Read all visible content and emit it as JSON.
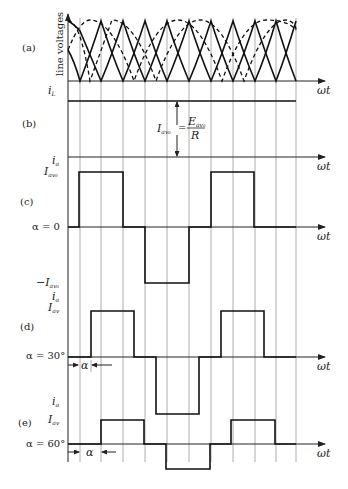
{
  "figure": {
    "panels": [
      {
        "id": "a",
        "label": "(a)",
        "ylabel": "line voltages",
        "xlabel": "ωt"
      },
      {
        "id": "b",
        "label": "(b)",
        "ylabel": "i_L",
        "xlabel": "ωt",
        "annotation": "I_av0 = E_av0 / R"
      },
      {
        "id": "c",
        "label": "(c)",
        "ylabel": "i_a",
        "level_pos": "I_av0",
        "level_neg": "−I_av0",
        "alpha": "α = 0",
        "xlabel": "ωt"
      },
      {
        "id": "d",
        "label": "(d)",
        "ylabel": "i_a",
        "level_pos": "I_av",
        "alpha": "α = 30°",
        "alpha_marker": "α",
        "xlabel": "ωt"
      },
      {
        "id": "e",
        "label": "(e)",
        "ylabel": "i_a",
        "level_pos": "I_av",
        "alpha": "α = 60°",
        "alpha_marker": "α",
        "xlabel": "ωt"
      }
    ],
    "text": {
      "a_label": "(a)",
      "b_label": "(b)",
      "c_label": "(c)",
      "d_label": "(d)",
      "e_label": "(e)",
      "line_voltages": "line voltages",
      "wt": "ωt",
      "iL": "i",
      "iL_sub": "L",
      "ia": "i",
      "ia_sub": "a",
      "Iav": "I",
      "Iav_sub": "av",
      "Iav0_sub": "av₀",
      "eq_lhs": "I",
      "eq_lhs_sub": "av₀",
      "eq_eq": "=",
      "eq_num": "E",
      "eq_num_sub": "av₀",
      "eq_den": "R",
      "alpha0": "α = 0",
      "alpha30": "α = 30°",
      "alpha60": "α = 60°",
      "alpha": "α",
      "neg": "−I"
    }
  }
}
